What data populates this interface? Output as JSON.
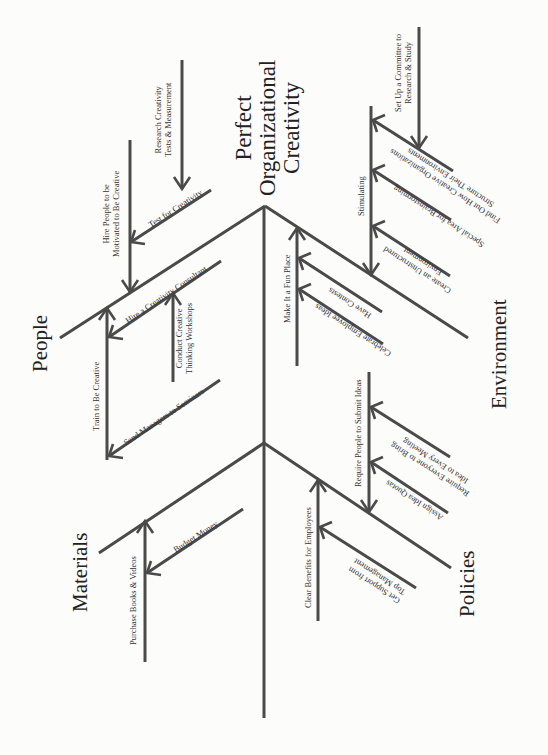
{
  "diagram": {
    "type": "fishbone",
    "effect": {
      "label_lines": [
        "Perfect",
        "Organizational",
        "Creativity"
      ]
    },
    "categories": [
      {
        "name": "People",
        "causes": [
          {
            "label": "Test for Creativity",
            "subcauses": [
              "Research Creativity Tests & Measurement"
            ]
          },
          {
            "label": "Hire People to be Motivated to Be Creative"
          },
          {
            "label": "Hire a Creativity Consultant",
            "subcauses": [
              "Conduct Creative Thinking Workshops"
            ]
          },
          {
            "label": "Train to Be Creative",
            "subcauses": [
              "Send Managers to Seminars"
            ]
          }
        ]
      },
      {
        "name": "Environment",
        "causes": [
          {
            "label": "Stimulating",
            "subcauses": [
              "Find Out How Creative Organizations Structure Their Environments",
              "Special Area for Brainstorming",
              "Create an Unstructured Environment"
            ]
          },
          {
            "label": "Set Up a Committee to Research & Study"
          },
          {
            "label": "Make It a Fun Place",
            "subcauses": [
              "Have Contests",
              "Celebrate Employee Ideas"
            ]
          }
        ]
      },
      {
        "name": "Materials",
        "causes": [
          {
            "label": "Purchase Books & Videos",
            "subcauses": [
              "Budget Money"
            ]
          }
        ]
      },
      {
        "name": "Policies",
        "causes": [
          {
            "label": "Require People to Submit Ideas",
            "subcauses": [
              "Require Everyone to Bring Idea to Every Meeting",
              "Assign Idea Quotas"
            ]
          },
          {
            "label": "Clear Benefits for Employees",
            "subcauses": [
              "Get Support from Top Management"
            ]
          }
        ]
      }
    ]
  },
  "labels": {
    "title_1": "Perfect",
    "title_2": "Organizational",
    "title_3": "Creativity",
    "people": "People",
    "environment": "Environment",
    "materials": "Materials",
    "policies": "Policies",
    "research_1": "Research Creativity",
    "research_2": "Tests & Measurement",
    "test": "Test for Creativity",
    "hire_people_1": "Hire People to be",
    "hire_people_2": "Motivated to Be Creative",
    "hire_consultant": "Hire a Creativity Consultant",
    "conduct_1": "Conduct Creative",
    "conduct_2": "Thinking Workshops",
    "train": "Train to Be Creative",
    "send": "Send Managers to Seminars",
    "setup_1": "Set Up a Committee to",
    "setup_2": "Research & Study",
    "stimulating": "Stimulating",
    "findout_1": "Find Out How Creative Organizations",
    "findout_2": "Structure Their Environments",
    "special": "Special Area for Brainstorming",
    "unstructured_1": "Create an Unstructured",
    "unstructured_2": "Environment",
    "fun": "Make It a Fun Place",
    "contests": "Have Contests",
    "celebrate": "Celebrate Employee Ideas",
    "require": "Require People to Submit Ideas",
    "everyone_1": "Require Everyone to Bring",
    "everyone_2": "Idea to Every Meeting",
    "quotas": "Assign Idea Quotas",
    "benefits": "Clear Benefits for Employees",
    "support_1": "Get Support from",
    "support_2": "Top Management",
    "purchase": "Purchase Books & Videos",
    "budget": "Budget Money"
  },
  "colors": {
    "line": "#4a4a4a",
    "text": "#333333",
    "background": "#fcfcfb"
  }
}
